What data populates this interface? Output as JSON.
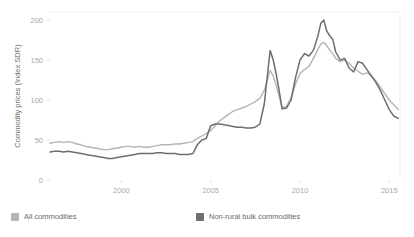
{
  "chart_data": {
    "type": "line",
    "title": "",
    "subtitle": "",
    "xlabel": "",
    "ylabel": "Commodity prices (Index SDR)",
    "xlim": [
      1996.0,
      2015.6
    ],
    "ylim": [
      0,
      210
    ],
    "yticks": [
      0,
      50,
      100,
      150,
      200
    ],
    "ytick_labels": [
      "0",
      "50",
      "100",
      "150",
      "200"
    ],
    "xticks": [
      2000,
      2005,
      2010,
      2015
    ],
    "xtick_labels": [
      "2000",
      "2005",
      "2010",
      "2015"
    ],
    "grid": false,
    "legend_position": "bottom",
    "colors": {
      "all_commodities": "#b4b4b4",
      "non_rural_bulk": "#6e6e6e",
      "axis_text": "#a8a8a8",
      "plot_border": "#efefef",
      "background": "#ffffff"
    },
    "series": [
      {
        "name": "All commodities",
        "color": "#b4b4b4",
        "x": [
          1996.0,
          1996.25,
          1996.5,
          1996.75,
          1997.0,
          1997.25,
          1997.5,
          1997.75,
          1998.0,
          1998.25,
          1998.5,
          1998.75,
          1999.0,
          1999.25,
          1999.5,
          1999.75,
          2000.0,
          2000.25,
          2000.5,
          2000.75,
          2001.0,
          2001.25,
          2001.5,
          2001.75,
          2002.0,
          2002.25,
          2002.5,
          2002.75,
          2003.0,
          2003.25,
          2003.5,
          2003.75,
          2004.0,
          2004.25,
          2004.5,
          2004.75,
          2005.0,
          2005.25,
          2005.5,
          2005.75,
          2006.0,
          2006.25,
          2006.5,
          2006.75,
          2007.0,
          2007.25,
          2007.5,
          2007.75,
          2008.0,
          2008.17,
          2008.33,
          2008.5,
          2008.67,
          2008.83,
          2009.0,
          2009.25,
          2009.5,
          2009.75,
          2010.0,
          2010.25,
          2010.5,
          2010.75,
          2011.0,
          2011.17,
          2011.33,
          2011.5,
          2011.67,
          2011.83,
          2012.0,
          2012.25,
          2012.5,
          2012.75,
          2013.0,
          2013.25,
          2013.5,
          2013.75,
          2014.0,
          2014.25,
          2014.5,
          2014.75,
          2015.0,
          2015.25,
          2015.5
        ],
        "y": [
          46,
          47,
          48,
          47,
          48,
          47,
          45,
          44,
          42,
          41,
          40,
          39,
          38,
          38,
          39,
          40,
          41,
          42,
          42,
          41,
          42,
          41,
          41,
          42,
          43,
          44,
          44,
          44,
          45,
          45,
          46,
          47,
          48,
          52,
          55,
          58,
          62,
          68,
          74,
          78,
          82,
          86,
          88,
          90,
          92,
          95,
          98,
          102,
          112,
          125,
          137,
          130,
          118,
          105,
          90,
          92,
          103,
          120,
          133,
          138,
          142,
          152,
          163,
          170,
          172,
          168,
          162,
          158,
          152,
          148,
          150,
          146,
          140,
          136,
          132,
          134,
          130,
          124,
          116,
          108,
          100,
          94,
          88
        ]
      },
      {
        "name": "Non-rural bulk commodities",
        "color": "#6e6e6e",
        "x": [
          1996.0,
          1996.25,
          1996.5,
          1996.75,
          1997.0,
          1997.25,
          1997.5,
          1997.75,
          1998.0,
          1998.25,
          1998.5,
          1998.75,
          1999.0,
          1999.25,
          1999.5,
          1999.75,
          2000.0,
          2000.25,
          2000.5,
          2000.75,
          2001.0,
          2001.25,
          2001.5,
          2001.75,
          2002.0,
          2002.25,
          2002.5,
          2002.75,
          2003.0,
          2003.25,
          2003.5,
          2003.75,
          2004.0,
          2004.25,
          2004.5,
          2004.75,
          2005.0,
          2005.25,
          2005.5,
          2005.75,
          2006.0,
          2006.25,
          2006.5,
          2006.75,
          2007.0,
          2007.25,
          2007.5,
          2007.75,
          2008.0,
          2008.17,
          2008.33,
          2008.5,
          2008.67,
          2008.83,
          2009.0,
          2009.25,
          2009.5,
          2009.75,
          2010.0,
          2010.25,
          2010.5,
          2010.75,
          2011.0,
          2011.17,
          2011.33,
          2011.5,
          2011.67,
          2011.83,
          2012.0,
          2012.25,
          2012.5,
          2012.75,
          2013.0,
          2013.25,
          2013.5,
          2013.75,
          2014.0,
          2014.25,
          2014.5,
          2014.75,
          2015.0,
          2015.25,
          2015.5
        ],
        "y": [
          35,
          36,
          36,
          35,
          36,
          35,
          34,
          33,
          32,
          31,
          30,
          29,
          28,
          27,
          27,
          28,
          29,
          30,
          31,
          32,
          33,
          33,
          33,
          33,
          34,
          34,
          33,
          33,
          33,
          32,
          32,
          32,
          33,
          44,
          50,
          52,
          68,
          70,
          70,
          69,
          68,
          67,
          66,
          66,
          65,
          65,
          66,
          70,
          95,
          130,
          162,
          150,
          132,
          112,
          89,
          90,
          100,
          128,
          150,
          158,
          155,
          162,
          180,
          196,
          200,
          186,
          180,
          176,
          160,
          150,
          152,
          140,
          135,
          148,
          146,
          138,
          130,
          122,
          112,
          100,
          88,
          80,
          77
        ]
      }
    ]
  },
  "axis": {
    "y_title": "Commodity prices (Index SDR)"
  },
  "legend": {
    "items": [
      {
        "label": "All commodities",
        "color": "#b4b4b4",
        "swatch": "legend-swatch-light"
      },
      {
        "label": "Non-rural bulk commodities",
        "color": "#6e6e6e",
        "swatch": "legend-swatch-dark"
      }
    ]
  }
}
